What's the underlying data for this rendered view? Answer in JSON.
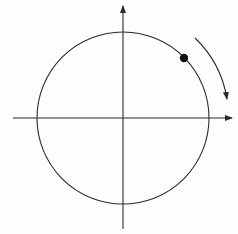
{
  "diagram": {
    "canvas": {
      "width": 238,
      "height": 234,
      "background": "#fdfdfd"
    },
    "colors": {
      "stroke": "#2a2a2a",
      "dot": "#111111"
    },
    "axes": {
      "origin": [
        123,
        118
      ],
      "x_axis": {
        "from": [
          13,
          118
        ],
        "to": [
          232,
          118
        ],
        "arrow": "right"
      },
      "y_axis": {
        "from": [
          123,
          229
        ],
        "to": [
          123,
          6
        ],
        "arrow": "up"
      }
    },
    "circle": {
      "cx": 123,
      "cy": 118,
      "r": 86
    },
    "point": {
      "cx": 184,
      "cy": 58,
      "r": 4.2,
      "quadrant": "I"
    },
    "rotation_arrow": {
      "direction": "clockwise",
      "start": [
        195,
        38
      ],
      "end": [
        227,
        99
      ]
    },
    "labels": []
  }
}
